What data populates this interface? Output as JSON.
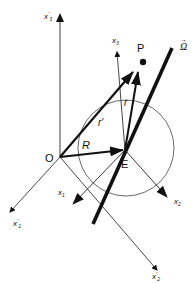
{
  "figure": {
    "width": 196,
    "height": 283,
    "colors": {
      "line": "#111111",
      "axis_gray": "#888888",
      "background": "#ffffff"
    },
    "points": {
      "O": {
        "label": "O"
      },
      "E": {
        "label": "E"
      },
      "P": {
        "label": "P"
      }
    },
    "vectors": {
      "R": {
        "label": "R"
      },
      "r_prime": {
        "label": "r'"
      },
      "r": {
        "label": "r"
      },
      "omega": {
        "label": "Ω",
        "arrow": "→"
      }
    },
    "axes": {
      "fixed": [
        {
          "name": "x'1",
          "base": "x",
          "prime": "'",
          "sub": "1"
        },
        {
          "name": "x'2",
          "base": "x",
          "prime": "'",
          "sub": "2"
        },
        {
          "name": "x'3",
          "base": "x",
          "prime": "'",
          "sub": "3"
        }
      ],
      "body": [
        {
          "name": "x1",
          "base": "x",
          "sub": "1"
        },
        {
          "name": "x2",
          "base": "x",
          "sub": "2"
        },
        {
          "name": "x3",
          "base": "x",
          "sub": "3"
        }
      ]
    }
  }
}
